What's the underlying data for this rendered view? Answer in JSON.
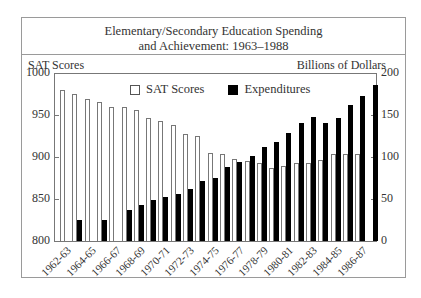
{
  "chart_data": {
    "type": "bar",
    "title": "Elementary/Secondary Education Spending and Achievement: 1963–1988",
    "title_lines": [
      "Elementary/Secondary Education Spending",
      "and Achievement: 1963–1988"
    ],
    "ylabel_left": "SAT Scores",
    "ylabel_right": "Billions of Dollars",
    "ylim_left": [
      800,
      1000
    ],
    "ylim_right": [
      0,
      200
    ],
    "yticks_left": [
      "1000",
      "950",
      "900",
      "850",
      "800"
    ],
    "yticks_right": [
      "200",
      "150",
      "100",
      "50",
      "0"
    ],
    "legend": [
      "SAT Scores",
      "Expenditures"
    ],
    "legend_position": "top-left inside",
    "grid": false,
    "categories": [
      "1962-63",
      "1963-64",
      "1964-65",
      "1965-66",
      "1966-67",
      "1967-68",
      "1968-69",
      "1969-70",
      "1970-71",
      "1971-72",
      "1972-73",
      "1973-74",
      "1974-75",
      "1975-76",
      "1976-77",
      "1977-78",
      "1978-79",
      "1979-80",
      "1980-81",
      "1981-82",
      "1982-83",
      "1983-84",
      "1984-85",
      "1985-86",
      "1986-87",
      "1987-88"
    ],
    "xtick_labels": [
      "1962-63",
      "1964-65",
      "1966-67",
      "1968-69",
      "1970-71",
      "1972-73",
      "1974-75",
      "1976-77",
      "1978-79",
      "1980-81",
      "1982-83",
      "1984-85",
      "1986-87"
    ],
    "series": [
      {
        "name": "SAT Scores",
        "axis": "left",
        "color": "#ffffff",
        "values": [
          980,
          975,
          969,
          966,
          959,
          960,
          956,
          947,
          943,
          938,
          927,
          925,
          905,
          903,
          898,
          895,
          893,
          887,
          889,
          893,
          893,
          896,
          903,
          904,
          904,
          null
        ]
      },
      {
        "name": "Expenditures",
        "axis": "right",
        "color": "#000000",
        "values": [
          null,
          25,
          null,
          25,
          null,
          37,
          43,
          49,
          52,
          56,
          62,
          71,
          75,
          88,
          94,
          101,
          112,
          118,
          128,
          141,
          148,
          141,
          147,
          162,
          173,
          186
        ]
      }
    ]
  }
}
